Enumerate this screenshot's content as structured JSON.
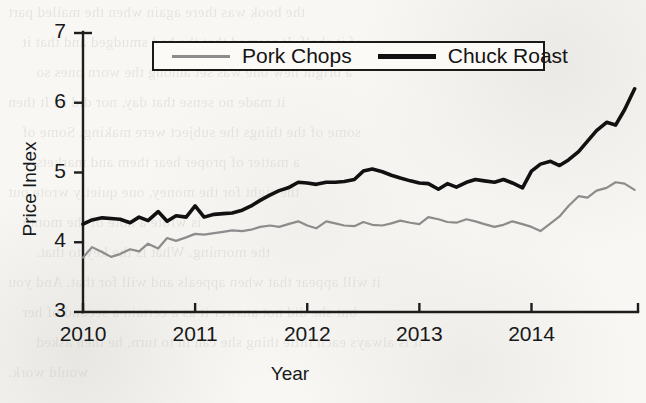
{
  "chart_data": {
    "type": "line",
    "title": "",
    "xlabel": "Year",
    "ylabel": "Price Index",
    "xlim": [
      2010.0,
      2014.95
    ],
    "ylim": [
      3,
      7
    ],
    "yticks": [
      3,
      4,
      5,
      6,
      7
    ],
    "xticks": [
      2010,
      2011,
      2012,
      2013,
      2014
    ],
    "xtick_labels": [
      "2010",
      "2011",
      "2012",
      "2013",
      "2014"
    ],
    "ytick_labels": [
      "3",
      "4",
      "5",
      "6",
      "7"
    ],
    "grid": false,
    "legend_position": "top-center",
    "legend_border": true,
    "series": [
      {
        "name": "Pork Chops",
        "color": "#8c8c8c",
        "line_width": 2.2,
        "x": [
          2010.0,
          2010.08,
          2010.17,
          2010.25,
          2010.33,
          2010.42,
          2010.5,
          2010.58,
          2010.67,
          2010.75,
          2010.83,
          2010.92,
          2011.0,
          2011.08,
          2011.17,
          2011.25,
          2011.33,
          2011.42,
          2011.5,
          2011.58,
          2011.67,
          2011.75,
          2011.83,
          2011.92,
          2012.0,
          2012.08,
          2012.17,
          2012.25,
          2012.33,
          2012.42,
          2012.5,
          2012.58,
          2012.67,
          2012.75,
          2012.83,
          2012.92,
          2013.0,
          2013.08,
          2013.17,
          2013.25,
          2013.33,
          2013.42,
          2013.5,
          2013.58,
          2013.67,
          2013.75,
          2013.83,
          2013.92,
          2014.0,
          2014.08,
          2014.17,
          2014.25,
          2014.33,
          2014.42,
          2014.5,
          2014.58,
          2014.67,
          2014.75,
          2014.83,
          2014.92
        ],
        "values": [
          3.78,
          3.93,
          3.86,
          3.79,
          3.83,
          3.9,
          3.87,
          3.98,
          3.91,
          4.06,
          4.02,
          4.07,
          4.12,
          4.11,
          4.13,
          4.15,
          4.17,
          4.16,
          4.18,
          4.22,
          4.24,
          4.22,
          4.26,
          4.3,
          4.24,
          4.2,
          4.3,
          4.27,
          4.24,
          4.23,
          4.29,
          4.25,
          4.24,
          4.27,
          4.31,
          4.28,
          4.26,
          4.36,
          4.33,
          4.29,
          4.28,
          4.33,
          4.3,
          4.26,
          4.22,
          4.25,
          4.3,
          4.26,
          4.22,
          4.16,
          4.27,
          4.37,
          4.52,
          4.66,
          4.64,
          4.74,
          4.78,
          4.86,
          4.84,
          4.75
        ]
      },
      {
        "name": "Chuck Roast",
        "color": "#111111",
        "line_width": 3.6,
        "x": [
          2010.0,
          2010.08,
          2010.17,
          2010.25,
          2010.33,
          2010.42,
          2010.5,
          2010.58,
          2010.67,
          2010.75,
          2010.83,
          2010.92,
          2011.0,
          2011.08,
          2011.17,
          2011.25,
          2011.33,
          2011.42,
          2011.5,
          2011.58,
          2011.67,
          2011.75,
          2011.83,
          2011.92,
          2012.0,
          2012.08,
          2012.17,
          2012.25,
          2012.33,
          2012.42,
          2012.5,
          2012.58,
          2012.67,
          2012.75,
          2012.83,
          2012.92,
          2013.0,
          2013.08,
          2013.17,
          2013.25,
          2013.33,
          2013.42,
          2013.5,
          2013.58,
          2013.67,
          2013.75,
          2013.83,
          2013.92,
          2014.0,
          2014.08,
          2014.17,
          2014.25,
          2014.33,
          2014.42,
          2014.5,
          2014.58,
          2014.67,
          2014.75,
          2014.83,
          2014.92
        ],
        "values": [
          4.26,
          4.32,
          4.35,
          4.34,
          4.33,
          4.28,
          4.36,
          4.31,
          4.44,
          4.3,
          4.38,
          4.36,
          4.52,
          4.36,
          4.4,
          4.41,
          4.42,
          4.46,
          4.52,
          4.6,
          4.68,
          4.74,
          4.78,
          4.86,
          4.85,
          4.83,
          4.86,
          4.86,
          4.87,
          4.9,
          5.02,
          5.05,
          5.01,
          4.96,
          4.92,
          4.88,
          4.85,
          4.84,
          4.76,
          4.84,
          4.79,
          4.86,
          4.9,
          4.88,
          4.86,
          4.9,
          4.85,
          4.78,
          5.02,
          5.12,
          5.16,
          5.1,
          5.18,
          5.3,
          5.45,
          5.6,
          5.72,
          5.68,
          5.9,
          6.2
        ]
      }
    ]
  },
  "legend": {
    "items": [
      {
        "label": "Pork Chops"
      },
      {
        "label": "Chuck Roast"
      }
    ]
  },
  "page_bleed": {
    "lines": [
      "the book was there again when the mailed part",
      "of it shelf. It seemed that the had smudged and that it",
      "a bright new one was set among the worn ones so",
      "it made no sense that day, nor did it. It then",
      "some of the things the subject were making. Some of",
      "a matter of proper hear them and markets",
      "the right for the money, one quietly wrote out",
      "is wrote a note of the month",
      "the morning. What is the key to that.",
      "it will appear that when appeals and will for that. And you",
      "but she did not answer it as a certain a second of her",
      "it is always each little thing she can in to turn, he then asked",
      "would work."
    ]
  }
}
